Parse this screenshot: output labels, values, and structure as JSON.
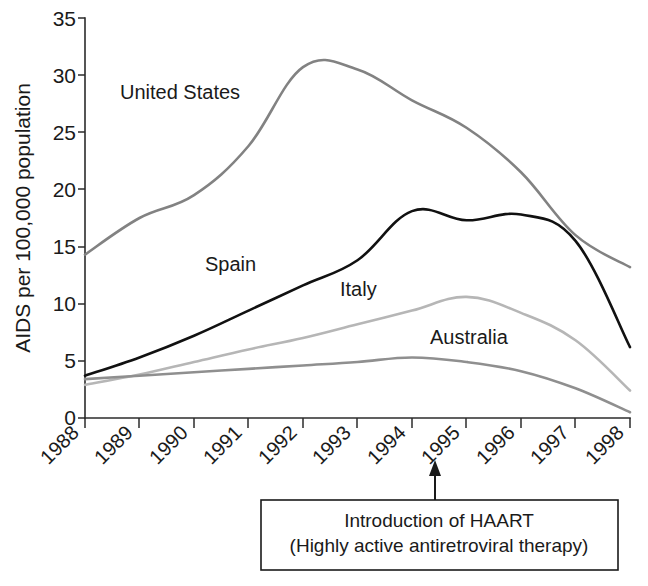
{
  "chart_data": {
    "type": "line",
    "title": "",
    "xlabel": "",
    "ylabel": "AIDS per 100,000 population",
    "categories": [
      "1988",
      "1989",
      "1990",
      "1991",
      "1992",
      "1993",
      "1994",
      "1995",
      "1996",
      "1997",
      "1998"
    ],
    "x": [
      1988,
      1989,
      1990,
      1991,
      1992,
      1993,
      1994,
      1995,
      1996,
      1997,
      1998
    ],
    "ylim": [
      0,
      35
    ],
    "yticks": [
      "0",
      "5",
      "10",
      "15",
      "20",
      "25",
      "30",
      "35"
    ],
    "ytick_values": [
      0,
      5,
      10,
      15,
      20,
      25,
      30,
      35
    ],
    "grid": false,
    "legend_position": "inline-labels",
    "series": [
      {
        "name": "United States",
        "color": "#828282",
        "values": [
          14.3,
          17.5,
          19.5,
          23.8,
          30.7,
          30.5,
          27.8,
          25.4,
          21.5,
          16.0,
          13.2
        ]
      },
      {
        "name": "Spain",
        "color": "#111111",
        "values": [
          3.7,
          5.3,
          7.2,
          9.4,
          11.6,
          13.8,
          18.1,
          17.3,
          17.8,
          15.5,
          6.2
        ]
      },
      {
        "name": "Italy",
        "color": "#b6b6b6",
        "values": [
          2.9,
          3.8,
          4.9,
          6.0,
          7.0,
          8.2,
          9.4,
          10.6,
          9.2,
          6.8,
          2.4
        ]
      },
      {
        "name": "Australia",
        "color": "#8f8f8f",
        "values": [
          3.4,
          3.7,
          4.0,
          4.3,
          4.6,
          4.9,
          5.3,
          4.9,
          4.1,
          2.6,
          0.5
        ]
      }
    ],
    "annotations": [
      {
        "name": "haart-callout",
        "line1": "Introduction of HAART",
        "line2": "(Highly active antiretroviral therapy)",
        "points_to_x": 1994.4
      }
    ]
  },
  "series_labels": {
    "united_states": "United States",
    "spain": "Spain",
    "italy": "Italy",
    "australia": "Australia"
  },
  "axis": {
    "y_title": "AIDS per 100,000 population"
  }
}
